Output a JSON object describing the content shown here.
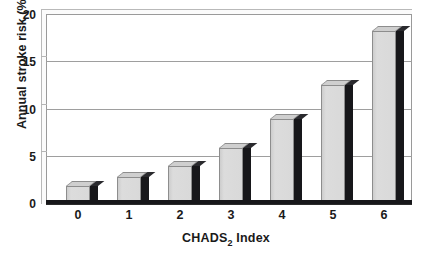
{
  "chart_data": {
    "type": "bar",
    "title": "",
    "subtitle": "",
    "xlabel": "CHADS2 Index",
    "xlabel_base": "CHADS",
    "xlabel_sub": "2",
    "xlabel_tail": " Index",
    "ylabel": "Annual stroke risk (%)",
    "categories": [
      "0",
      "1",
      "2",
      "3",
      "4",
      "5",
      "6"
    ],
    "values": [
      1.9,
      2.8,
      4.0,
      5.9,
      9.0,
      12.5,
      18.2
    ],
    "series": [
      {
        "name": "Annual stroke risk",
        "values": [
          1.9,
          2.8,
          4.0,
          5.9,
          9.0,
          12.5,
          18.2
        ]
      }
    ],
    "ylim": [
      0,
      20
    ],
    "yticks": [
      0,
      5,
      10,
      15,
      20
    ],
    "ytick_labels": [
      "0",
      "5",
      "10",
      "15",
      "20"
    ],
    "xlim_categories": 7,
    "grid": "horizontal",
    "legend": "none",
    "bar_face_color": "#d6d6d6",
    "bar_side_color": "#17171a",
    "axis_color": "#17171a",
    "grid_color": "#9e9e9e",
    "background_color": "#ffffff",
    "style": "3d-column",
    "annotations": []
  }
}
